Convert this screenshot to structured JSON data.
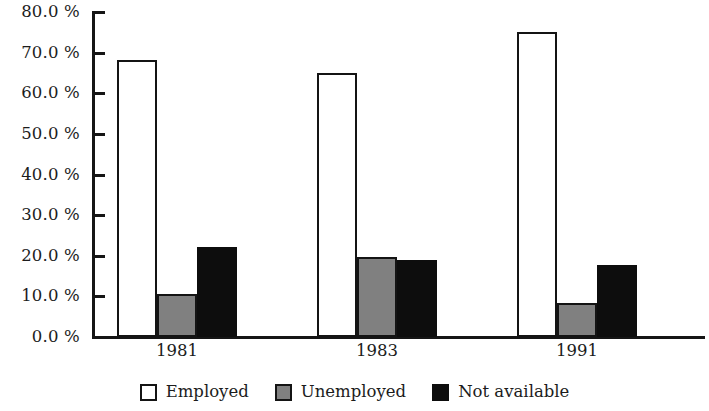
{
  "chart_data": {
    "type": "bar",
    "title": "",
    "subtitle": "",
    "xlabel": "",
    "ylabel": "",
    "categories": [
      "1981",
      "1983",
      "1991"
    ],
    "series": [
      {
        "name": "Employed",
        "color": "#ffffff",
        "values": [
          68.2,
          65.0,
          75.1
        ]
      },
      {
        "name": "Unemployed",
        "color": "#808080",
        "values": [
          10.6,
          19.7,
          8.4
        ]
      },
      {
        "name": "Not available",
        "color": "#0d0d0d",
        "values": [
          22.2,
          19.0,
          17.7
        ]
      }
    ],
    "ylim": [
      0,
      80
    ],
    "ytick_values": [
      0,
      10,
      20,
      30,
      40,
      50,
      60,
      70,
      80
    ],
    "ytick_labels": [
      "0.0 %",
      "10.0 %",
      "20.0 %",
      "30.0 %",
      "40.0 %",
      "50.0 %",
      "60.0 %",
      "70.0 %",
      "80.0 %"
    ],
    "grid": false,
    "legend_position": "bottom",
    "value_format": "percent",
    "axis_color": "#151515",
    "bar_border_color": "#141414",
    "background": "#ffffff"
  },
  "legend": {
    "entries": [
      {
        "label": "Employed",
        "swatch": "legend-swatch-employed"
      },
      {
        "label": "Unemployed",
        "swatch": "legend-swatch-unemployed"
      },
      {
        "label": "Not available",
        "swatch": "legend-swatch-not-available"
      }
    ]
  }
}
